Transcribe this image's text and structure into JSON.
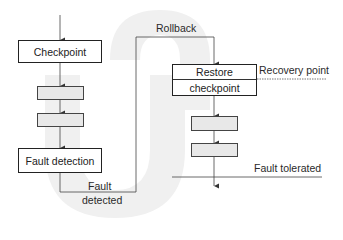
{
  "diagram": {
    "nodes": {
      "checkpoint": "Checkpoint",
      "fault_detection": "Fault detection",
      "restore_line1": "Restore",
      "restore_line2": "checkpoint"
    },
    "edge_labels": {
      "rollback": "Rollback",
      "fault_detected_line1": "Fault",
      "fault_detected_line2": "detected"
    },
    "markers": {
      "recovery_point": "Recovery point",
      "fault_tolerated": "Fault tolerated"
    },
    "colors": {
      "line": "#333333",
      "grey_box_fill": "#e8e8e8",
      "u_shape_fill": "#efefef"
    }
  }
}
